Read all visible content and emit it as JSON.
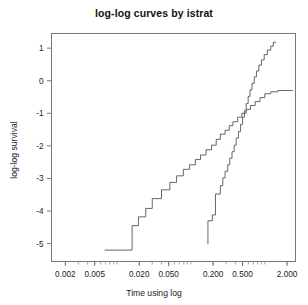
{
  "chart_data": {
    "type": "line",
    "title": "log-log curves by istrat",
    "xlabel": "Time using log",
    "ylabel": "log-log survival",
    "grid": false,
    "legend": null,
    "x_scale": "log",
    "xlim": [
      0.0013,
      2.6
    ],
    "ylim": [
      -5.55,
      1.45
    ],
    "xticks": [
      {
        "value": 0.002,
        "label": "0.002"
      },
      {
        "value": 0.005,
        "label": "0.005"
      },
      {
        "value": 0.02,
        "label": "0.020"
      },
      {
        "value": 0.05,
        "label": "0.050"
      },
      {
        "value": 0.2,
        "label": "0.200"
      },
      {
        "value": 0.5,
        "label": "0.500"
      },
      {
        "value": 2.0,
        "label": "2.000"
      }
    ],
    "yticks": [
      {
        "value": 1,
        "label": "1"
      },
      {
        "value": 0,
        "label": "0"
      },
      {
        "value": -1,
        "label": "-1"
      },
      {
        "value": -2,
        "label": "-2"
      },
      {
        "value": -3,
        "label": "-3"
      },
      {
        "value": -4,
        "label": "-4"
      },
      {
        "value": -5,
        "label": "-5"
      }
    ],
    "series": [
      {
        "name": "istrat group 1",
        "style": "step",
        "color": "#555555",
        "points": [
          [
            0.0068,
            -5.2
          ],
          [
            0.016,
            -5.2
          ],
          [
            0.016,
            -4.45
          ],
          [
            0.0195,
            -4.45
          ],
          [
            0.0195,
            -4.18
          ],
          [
            0.0245,
            -4.18
          ],
          [
            0.0245,
            -3.92
          ],
          [
            0.03,
            -3.92
          ],
          [
            0.03,
            -3.62
          ],
          [
            0.04,
            -3.62
          ],
          [
            0.04,
            -3.35
          ],
          [
            0.052,
            -3.35
          ],
          [
            0.052,
            -3.12
          ],
          [
            0.064,
            -3.12
          ],
          [
            0.064,
            -2.92
          ],
          [
            0.079,
            -2.92
          ],
          [
            0.079,
            -2.72
          ],
          [
            0.096,
            -2.72
          ],
          [
            0.096,
            -2.58
          ],
          [
            0.115,
            -2.58
          ],
          [
            0.115,
            -2.42
          ],
          [
            0.135,
            -2.42
          ],
          [
            0.135,
            -2.28
          ],
          [
            0.16,
            -2.28
          ],
          [
            0.16,
            -2.12
          ],
          [
            0.19,
            -2.12
          ],
          [
            0.19,
            -1.98
          ],
          [
            0.22,
            -1.98
          ],
          [
            0.22,
            -1.8
          ],
          [
            0.25,
            -1.8
          ],
          [
            0.25,
            -1.64
          ],
          [
            0.29,
            -1.64
          ],
          [
            0.29,
            -1.52
          ],
          [
            0.33,
            -1.52
          ],
          [
            0.33,
            -1.38
          ],
          [
            0.37,
            -1.38
          ],
          [
            0.37,
            -1.26
          ],
          [
            0.43,
            -1.26
          ],
          [
            0.43,
            -1.12
          ],
          [
            0.49,
            -1.12
          ],
          [
            0.49,
            -1.0
          ],
          [
            0.56,
            -1.0
          ],
          [
            0.56,
            -0.88
          ],
          [
            0.64,
            -0.88
          ],
          [
            0.64,
            -0.76
          ],
          [
            0.74,
            -0.76
          ],
          [
            0.74,
            -0.64
          ],
          [
            0.86,
            -0.64
          ],
          [
            0.86,
            -0.52
          ],
          [
            1.0,
            -0.52
          ],
          [
            1.0,
            -0.4
          ],
          [
            1.2,
            -0.4
          ],
          [
            1.2,
            -0.34
          ],
          [
            1.5,
            -0.34
          ],
          [
            1.5,
            -0.3
          ],
          [
            2.4,
            -0.3
          ]
        ]
      },
      {
        "name": "istrat group 2",
        "style": "step",
        "color": "#555555",
        "points": [
          [
            0.17,
            -5.02
          ],
          [
            0.17,
            -4.3
          ],
          [
            0.195,
            -4.3
          ],
          [
            0.195,
            -4.12
          ],
          [
            0.215,
            -4.12
          ],
          [
            0.215,
            -3.48
          ],
          [
            0.25,
            -3.48
          ],
          [
            0.25,
            -3.22
          ],
          [
            0.27,
            -3.22
          ],
          [
            0.27,
            -2.98
          ],
          [
            0.29,
            -2.98
          ],
          [
            0.29,
            -2.78
          ],
          [
            0.315,
            -2.78
          ],
          [
            0.315,
            -2.58
          ],
          [
            0.335,
            -2.58
          ],
          [
            0.335,
            -2.38
          ],
          [
            0.36,
            -2.38
          ],
          [
            0.36,
            -2.18
          ],
          [
            0.385,
            -2.18
          ],
          [
            0.385,
            -1.98
          ],
          [
            0.41,
            -1.98
          ],
          [
            0.41,
            -1.76
          ],
          [
            0.44,
            -1.76
          ],
          [
            0.44,
            -1.56
          ],
          [
            0.47,
            -1.56
          ],
          [
            0.47,
            -1.34
          ],
          [
            0.5,
            -1.34
          ],
          [
            0.5,
            -1.12
          ],
          [
            0.53,
            -1.12
          ],
          [
            0.53,
            -0.92
          ],
          [
            0.56,
            -0.92
          ],
          [
            0.56,
            -0.7
          ],
          [
            0.595,
            -0.7
          ],
          [
            0.595,
            -0.48
          ],
          [
            0.63,
            -0.48
          ],
          [
            0.63,
            -0.28
          ],
          [
            0.67,
            -0.28
          ],
          [
            0.67,
            -0.08
          ],
          [
            0.72,
            -0.08
          ],
          [
            0.72,
            0.12
          ],
          [
            0.77,
            0.12
          ],
          [
            0.77,
            0.3
          ],
          [
            0.83,
            0.3
          ],
          [
            0.83,
            0.48
          ],
          [
            0.9,
            0.48
          ],
          [
            0.9,
            0.64
          ],
          [
            0.98,
            0.64
          ],
          [
            0.98,
            0.8
          ],
          [
            1.08,
            0.8
          ],
          [
            1.08,
            0.94
          ],
          [
            1.2,
            0.94
          ],
          [
            1.2,
            1.06
          ],
          [
            1.3,
            1.06
          ],
          [
            1.3,
            1.18
          ],
          [
            1.42,
            1.18
          ]
        ]
      }
    ]
  }
}
